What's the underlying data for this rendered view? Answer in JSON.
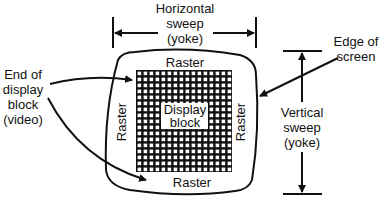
{
  "diagram": {
    "labels": {
      "horizontal_sweep": [
        "Horizontal",
        "sweep",
        "(yoke)"
      ],
      "vertical_sweep": [
        "Vertical",
        "sweep",
        "(yoke)"
      ],
      "edge_of_screen": [
        "Edge of",
        "screen"
      ],
      "end_of_display_block": [
        "End of",
        "display",
        "block",
        "(video)"
      ],
      "raster_top": "Raster",
      "raster_bottom": "Raster",
      "raster_left": "Raster",
      "raster_right": "Raster",
      "display_block": [
        "Display",
        "block"
      ]
    },
    "colors": {
      "ink": "#111111",
      "paper": "#ffffff"
    }
  }
}
